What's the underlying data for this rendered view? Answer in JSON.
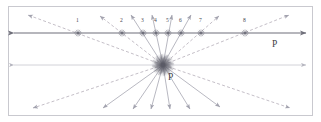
{
  "figure": {
    "background_color": "#ffffff",
    "border_color": "#c9c9cf",
    "frame": {
      "x": 8,
      "y": 6,
      "width": 305,
      "height": 110
    },
    "colors": {
      "main_line": "#6f6f7a",
      "ray_solid": "#9a9aa6",
      "ray_dashed": "#b0aab4",
      "marker": "#6b6b78",
      "center_burst": "#5a5a66",
      "faint_line": "#c6c6ce",
      "label_text": "#4a4a52"
    },
    "labels": {
      "line_label_right": "P",
      "center_label": "P"
    },
    "main_line": {
      "y": 33,
      "x_start": 14,
      "x_end": 306,
      "arrow_left": true,
      "arrow_right": true,
      "label": "P",
      "label_x": 272,
      "label_y": 47
    },
    "faint_line": {
      "y": 65,
      "x_start": 14,
      "x_end": 306,
      "arrow_left": true,
      "arrow_right": true
    },
    "center": {
      "x": 163,
      "y": 65,
      "label": "P",
      "label_x": 168,
      "label_y": 80,
      "burst_ray_count": 60,
      "burst_radius": 11
    },
    "marked_points": [
      {
        "label": "1",
        "x": 78,
        "y": 33,
        "label_x": 76,
        "label_y": 22
      },
      {
        "label": "2",
        "x": 122,
        "y": 33,
        "label_x": 120,
        "label_y": 22
      },
      {
        "label": "3",
        "x": 143,
        "y": 33,
        "label_x": 141,
        "label_y": 22
      },
      {
        "label": "4",
        "x": 156,
        "y": 33,
        "label_x": 154,
        "label_y": 22
      },
      {
        "label": "5",
        "x": 168,
        "y": 33,
        "label_x": 166,
        "label_y": 22
      },
      {
        "label": "6",
        "x": 181,
        "y": 33,
        "label_x": 179,
        "label_y": 22
      },
      {
        "label": "7",
        "x": 201,
        "y": 33,
        "label_x": 199,
        "label_y": 22
      },
      {
        "label": "8",
        "x": 245,
        "y": 33,
        "label_x": 243,
        "label_y": 22
      }
    ],
    "upper_rays": [
      {
        "tip_x": 28,
        "tip_y": 15,
        "style": "dashed"
      },
      {
        "tip_x": 100,
        "tip_y": 16,
        "style": "dashed"
      },
      {
        "tip_x": 131,
        "tip_y": 15,
        "style": "solid"
      },
      {
        "tip_x": 152,
        "tip_y": 15,
        "style": "solid"
      },
      {
        "tip_x": 172,
        "tip_y": 15,
        "style": "solid"
      },
      {
        "tip_x": 191,
        "tip_y": 15,
        "style": "solid"
      },
      {
        "tip_x": 219,
        "tip_y": 16,
        "style": "dashed"
      },
      {
        "tip_x": 289,
        "tip_y": 15,
        "style": "dashed"
      }
    ],
    "lower_rays": [
      {
        "tip_x": 33,
        "tip_y": 108,
        "style": "dashed"
      },
      {
        "tip_x": 103,
        "tip_y": 108,
        "style": "solid"
      },
      {
        "tip_x": 133,
        "tip_y": 109,
        "style": "solid"
      },
      {
        "tip_x": 151,
        "tip_y": 109,
        "style": "solid"
      },
      {
        "tip_x": 170,
        "tip_y": 109,
        "style": "solid"
      },
      {
        "tip_x": 190,
        "tip_y": 109,
        "style": "solid"
      },
      {
        "tip_x": 220,
        "tip_y": 107,
        "style": "solid"
      },
      {
        "tip_x": 290,
        "tip_y": 108,
        "style": "dashed"
      }
    ]
  }
}
